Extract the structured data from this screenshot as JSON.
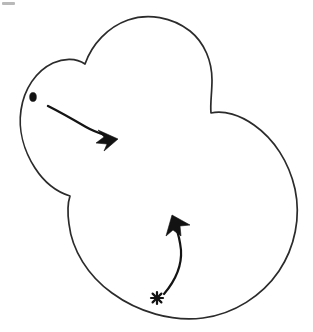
{
  "figure": {
    "title": "Hand-drawn blob outline with two curved motion arrows",
    "caption": "",
    "background_color": "#ffffff",
    "ink_color": "#2b2b2b",
    "arrow_color": "#121212",
    "canvas": {
      "width": 313,
      "height": 332
    }
  },
  "shape": {
    "name": "blob-outline",
    "description": "Closed irregular cloud-like contour made of three lobes: a small left lobe, a tall top lobe, and a large lower-right lobe",
    "stroke_color": "#2b2b2b",
    "fill_color": "#ffffff",
    "stroke_width": 1.7,
    "cusps": [
      {
        "label": "left-upper-notch",
        "x": 85,
        "y": 64
      },
      {
        "label": "right-upper-notch",
        "x": 211,
        "y": 113
      },
      {
        "label": "left-lower-notch",
        "x": 70,
        "y": 196
      }
    ],
    "extents": {
      "min_x": 17,
      "max_x": 297,
      "min_y": 17,
      "max_y": 318
    }
  },
  "markers": [
    {
      "name": "dot-marker",
      "glyph": "dot",
      "x": 33,
      "y": 97,
      "rx": 3.4,
      "ry": 4.6,
      "color": "#121212"
    },
    {
      "name": "asterisk-marker",
      "glyph": "asterisk",
      "x": 157,
      "y": 298,
      "radius": 6.2,
      "color": "#121212"
    }
  ],
  "arrows": [
    {
      "name": "arrow-upper",
      "label": "",
      "from_marker": "dot-marker",
      "to_point": {
        "x": 112,
        "y": 136
      },
      "start_point": {
        "x": 48,
        "y": 106
      },
      "direction": "right-down",
      "curvature": "convex-up",
      "shaft_width": 2.4,
      "color": "#121212"
    },
    {
      "name": "arrow-lower",
      "label": "",
      "from_marker": "asterisk-marker",
      "to_point": {
        "x": 176,
        "y": 220
      },
      "start_point": {
        "x": 163,
        "y": 294
      },
      "direction": "up-right",
      "curvature": "convex-right",
      "shaft_width": 2.2,
      "color": "#121212"
    }
  ],
  "artifacts": [
    {
      "name": "scan-smudge",
      "x": 2,
      "y": 2,
      "width": 13,
      "height": 3,
      "color": "#b9b9b9"
    }
  ]
}
